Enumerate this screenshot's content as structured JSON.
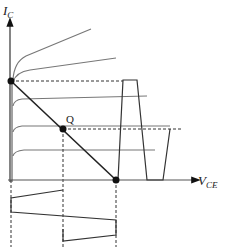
{
  "diagram": {
    "type": "transistor-load-line",
    "axes": {
      "y_label_main": "I",
      "y_label_sub": "C",
      "x_label_main": "V",
      "x_label_sub": "CE"
    },
    "points": {
      "q_label": "Q"
    },
    "colors": {
      "stroke": "#222222",
      "curve": "#777777",
      "dash": "#333333"
    }
  }
}
